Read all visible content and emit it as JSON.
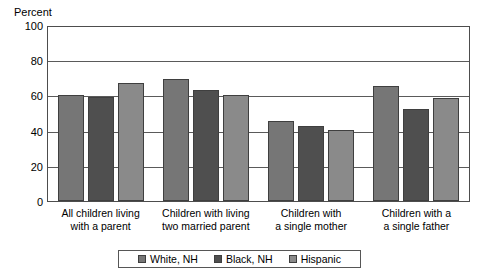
{
  "chart_data": {
    "type": "bar",
    "title": "",
    "xlabel": "",
    "ylabel": "Percent",
    "ylim": [
      0,
      100
    ],
    "yticks": [
      100,
      80,
      60,
      40,
      20,
      0
    ],
    "grid": true,
    "legend_position": "bottom",
    "categories": [
      "All children living with a parent",
      "Children with living two married parent",
      "Children with a single mother",
      "Children with a single father"
    ],
    "category_lines": [
      [
        "All children living",
        "with a parent"
      ],
      [
        "Children with living",
        "two married parent"
      ],
      [
        "Children with",
        "a single mother"
      ],
      [
        "Children with a",
        "a single father"
      ]
    ],
    "series": [
      {
        "name": "White, NH",
        "color": "#767676",
        "values": [
          61,
          70,
          46,
          66
        ]
      },
      {
        "name": "Black, NH",
        "color": "#4f4f4f",
        "values": [
          60,
          64,
          43,
          53
        ]
      },
      {
        "name": "Hispanic",
        "color": "#8a8a8a",
        "values": [
          68,
          61,
          41,
          59
        ]
      }
    ]
  },
  "legend": {
    "items": [
      {
        "label": "White, NH",
        "color": "#767676"
      },
      {
        "label": "Black, NH",
        "color": "#4f4f4f"
      },
      {
        "label": "Hispanic",
        "color": "#8a8a8a"
      }
    ]
  },
  "colors": {
    "frame": "#4d4d4d",
    "gridline": "#5a5a5a",
    "bar_border": "#3f3f3f",
    "background": "#ffffff",
    "text": "#000000"
  }
}
